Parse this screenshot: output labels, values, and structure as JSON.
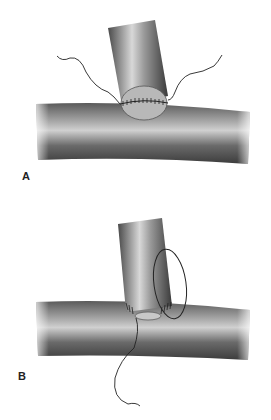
{
  "figure": {
    "panels": [
      {
        "label": "A",
        "description": "End-to-side anastomosis with continuous suture line around oval opening; suture ends extend on both sides"
      },
      {
        "label": "B",
        "description": "End-to-side anastomosis with running suture loop around posterior wall; suture tail extends downward"
      }
    ],
    "colors": {
      "vessel_dark": "#3a3a3a",
      "vessel_mid": "#777777",
      "vessel_light": "#cfcfcf",
      "suture": "#222222",
      "anastomosis_face": "#b8b8b8"
    }
  }
}
